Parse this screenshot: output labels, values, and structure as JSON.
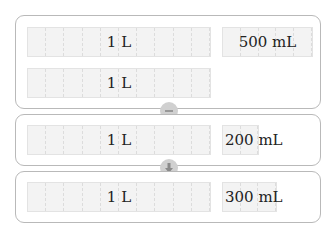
{
  "diagram": {
    "panels": [
      {
        "bars": [
          {
            "label": "1 L",
            "cells": 10
          },
          {
            "label": "500 mL",
            "cells": 5
          },
          {
            "label": "1 L",
            "cells": 10
          }
        ]
      },
      {
        "bars": [
          {
            "label": "1 L",
            "cells": 10
          },
          {
            "label": "200 mL",
            "cells": 2
          }
        ]
      },
      {
        "bars": [
          {
            "label": "1 L",
            "cells": 10
          },
          {
            "label": "300 mL",
            "cells": 3
          }
        ]
      }
    ],
    "operators": [
      {
        "icon": "minus-icon"
      },
      {
        "icon": "arrow-down-icon"
      }
    ],
    "colors": {
      "panel_border": "#b9b9b9",
      "bar_fill": "#f3f3f3",
      "operator_fill": "#d0d0d0",
      "operator_glyph": "#8a8a8a"
    }
  }
}
